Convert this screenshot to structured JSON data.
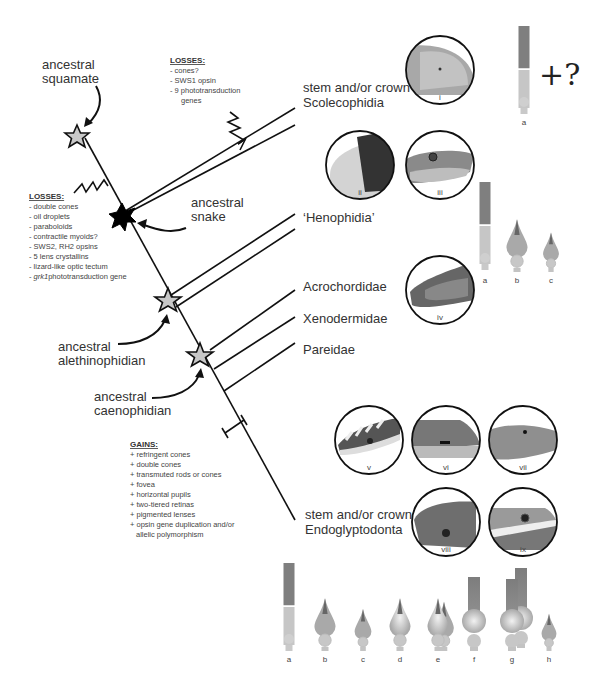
{
  "diagram": {
    "type": "phylogenetic-tree",
    "nodes": {
      "ancestral_squamate": "ancestral\nsquamate",
      "ancestral_snake": "ancestral\nsnake",
      "ancestral_alethinophidian": "ancestral\nalethinophidian",
      "ancestral_caenophidian": "ancestral\ncaenophidian"
    },
    "node_labels": {
      "squamate_l1": "ancestral",
      "squamate_l2": "squamate",
      "snake_l1": "ancestral",
      "snake_l2": "snake",
      "aleth_l1": "ancestral",
      "aleth_l2": "alethinophidian",
      "caeno_l1": "ancestral",
      "caeno_l2": "caenophidian"
    },
    "taxa": {
      "scoleco_l1": "stem and/or crown",
      "scoleco_l2": "Scolecophidia",
      "henophidia": "‘Henophidia’",
      "acrochordidae": "Acrochordidae",
      "xenodermidae": "Xenodermidae",
      "pareidae": "Pareidae",
      "endo_l1": "stem and/or crown",
      "endo_l2": "Endoglyptodonta"
    },
    "losses_scolecophidia": {
      "heading": "LOSSES:",
      "items": [
        "- cones?",
        "- SWS1 opsin",
        "- 9 phototransduction",
        "   genes"
      ]
    },
    "losses_snake": {
      "heading": "LOSSES:",
      "items": [
        "- double cones",
        "- oil droplets",
        "- paraboloids",
        "- contractile myoids?",
        "- SWS2, RH2 opsins",
        "- 5 lens crystallins",
        "- lizard-like optic tectum",
        "phototransduction gene"
      ],
      "italic_gene": "grk1",
      "dash": "- "
    },
    "gains": {
      "heading": "GAINS:",
      "items": [
        "+ refringent cones",
        "+ double cones",
        "+ transmuted rods or cones",
        "+ fovea",
        "+ horizontal pupils",
        "+ two-tiered retinas",
        "+ pigmented lenses",
        "+ opsin gene duplication and/or",
        "   allelic polymorphism"
      ]
    },
    "photos": [
      "i",
      "ii",
      "iii",
      "iv",
      "v",
      "vi",
      "vii",
      "viii",
      "ix"
    ],
    "photoreceptor_sets": {
      "scolecophidia": {
        "letters": [
          "a"
        ],
        "extra": "+?"
      },
      "henophidia": {
        "letters": [
          "a",
          "b",
          "c"
        ]
      },
      "endoglyptodonta": {
        "letters": [
          "a",
          "b",
          "c",
          "d",
          "e",
          "f",
          "g",
          "h"
        ]
      }
    },
    "colors": {
      "line": "#111111",
      "star_fill": "#c8c8c8",
      "snake_star": "#000000",
      "rod_outer": "#7a7a7a",
      "rod_inner": "#c4c4c4",
      "cone": "#a8a8a8"
    }
  }
}
